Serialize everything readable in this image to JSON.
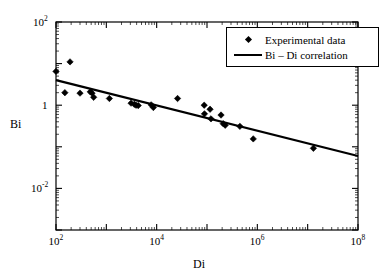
{
  "chart_data": {
    "type": "scatter",
    "title": "",
    "xlabel": "Di",
    "ylabel": "Bi",
    "xscale": "log",
    "yscale": "log",
    "xlim": [
      100,
      100000000
    ],
    "ylim": [
      0.001,
      100
    ],
    "grid": false,
    "legend_position": "top-right",
    "xticks": [
      {
        "value": 100,
        "label": "10",
        "exponent": "2"
      },
      {
        "value": 10000,
        "label": "10",
        "exponent": "4"
      },
      {
        "value": 1000000,
        "label": "10",
        "exponent": "6"
      },
      {
        "value": 100000000,
        "label": "10",
        "exponent": "8"
      }
    ],
    "yticks": [
      {
        "value": 100,
        "label": "10",
        "exponent": "2"
      },
      {
        "value": 1,
        "label": "1",
        "exponent": ""
      },
      {
        "value": 0.01,
        "label": "10",
        "exponent": "-2"
      }
    ],
    "series": [
      {
        "name": "Experimental data",
        "type": "scatter",
        "marker": "diamond",
        "color": "#000000",
        "points": [
          {
            "x": 100,
            "y": 6.5
          },
          {
            "x": 190,
            "y": 11.0
          },
          {
            "x": 150,
            "y": 2.0
          },
          {
            "x": 300,
            "y": 1.95
          },
          {
            "x": 480,
            "y": 2.1
          },
          {
            "x": 520,
            "y": 1.95
          },
          {
            "x": 560,
            "y": 1.55
          },
          {
            "x": 1150,
            "y": 1.45
          },
          {
            "x": 3100,
            "y": 1.12
          },
          {
            "x": 3600,
            "y": 1.05
          },
          {
            "x": 3900,
            "y": 1.0
          },
          {
            "x": 4300,
            "y": 0.98
          },
          {
            "x": 7800,
            "y": 1.02
          },
          {
            "x": 8600,
            "y": 0.88
          },
          {
            "x": 26000,
            "y": 1.45
          },
          {
            "x": 88000,
            "y": 1.0
          },
          {
            "x": 89000,
            "y": 0.62
          },
          {
            "x": 115000,
            "y": 0.8
          },
          {
            "x": 120000,
            "y": 0.47
          },
          {
            "x": 190000,
            "y": 0.58
          },
          {
            "x": 210000,
            "y": 0.36
          },
          {
            "x": 230000,
            "y": 0.33
          },
          {
            "x": 450000,
            "y": 0.31
          },
          {
            "x": 830000,
            "y": 0.155
          },
          {
            "x": 13000000,
            "y": 0.092
          }
        ]
      },
      {
        "name": "Bi – Di correlation",
        "type": "line",
        "color": "#000000",
        "line_points": [
          {
            "x": 100,
            "y": 4.0
          },
          {
            "x": 100000000,
            "y": 0.06
          }
        ]
      }
    ],
    "legend": [
      {
        "label": "Experimental data",
        "marker": "diamond"
      },
      {
        "label": "Bi – Di correlation",
        "marker": "line"
      }
    ]
  },
  "axes": {
    "y_title": "Bi",
    "x_title": "Di"
  },
  "colors": {
    "frame": "#000000",
    "marker": "#000000",
    "line": "#000000",
    "background": "#ffffff"
  }
}
